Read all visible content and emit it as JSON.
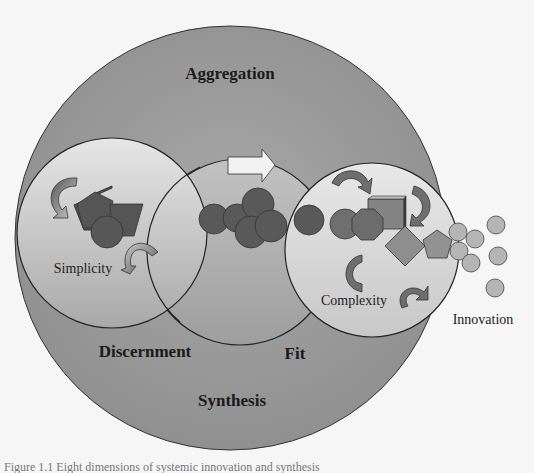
{
  "diagram": {
    "outer_circle": {
      "top_label": "Aggregation",
      "bottom_label": "Synthesis",
      "left_label": "Discernment",
      "center_label": "Fit"
    },
    "inner_circles": [
      {
        "label": "Simplicity"
      },
      {
        "label": ""
      },
      {
        "label": "Complexity"
      }
    ],
    "outside_label": "Innovation",
    "caption": "Figure 1.1 Eight dimensions of systemic innovation and synthesis"
  },
  "colors": {
    "background": "#f6f6f6",
    "outer_fill": "#9c9c9c",
    "inner_fill_light": "#dcdcdc",
    "inner_fill_mid": "#b8b8b8",
    "dark_shape": "#595959",
    "mid_shape": "#8a8a8a",
    "light_circle": "#b5b5b5"
  }
}
